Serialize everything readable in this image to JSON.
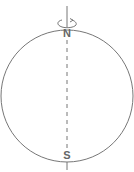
{
  "diagram": {
    "type": "globe-rotation-axis",
    "labels": {
      "north": "N",
      "south": "S",
      "caption": "rotation axis"
    },
    "colors": {
      "stroke": "#777777",
      "label": "#666666"
    }
  }
}
